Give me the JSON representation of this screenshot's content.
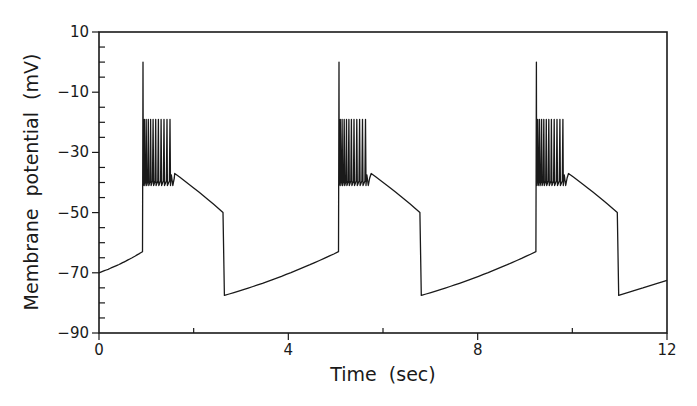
{
  "chart_data": {
    "type": "line",
    "title": "",
    "xlabel": "Time  (sec)",
    "ylabel": "Membrane  potential  (mV)",
    "xlim": [
      0,
      12
    ],
    "ylim": [
      -90,
      10
    ],
    "x_ticks": [
      0,
      4,
      8,
      12
    ],
    "x_tick_labels": [
      "0",
      "4",
      "8",
      "12"
    ],
    "x_minor_step": 2,
    "y_ticks": [
      10,
      -10,
      -30,
      -50,
      -70,
      -90
    ],
    "y_tick_labels": [
      "10",
      "−10",
      "−30",
      "−50",
      "−70",
      "−90"
    ],
    "y_minor_step": 5,
    "grid": false,
    "legend": null,
    "line_color": "#1a1a1a",
    "series": [
      {
        "name": "membrane-potential",
        "description": "Periodic bursting: slow depolarizing ramp, initial spike to ~0 mV, high-frequency spike burst between ~-41 and ~-19 mV, plateau decaying to ~-50 mV, then abrupt hyperpolarization to ~-77.5 mV",
        "cycles": [
          {
            "ramp_start": {
              "t": 0.0,
              "v": -70.0
            },
            "ramp_end": {
              "t": 0.92,
              "v": -63.0
            },
            "initial_spike_peak": {
              "t": 0.93,
              "v": 0.0
            },
            "burst_start_t": 0.93,
            "burst_end_t": 1.5,
            "burst_spikes": 11,
            "burst_peak_v": -19.0,
            "burst_trough_v": -41.0,
            "hump_peak": {
              "t": 1.6,
              "v": -37.0
            },
            "plateau_end": {
              "t": 2.62,
              "v": -50.0
            },
            "hyperpolarized": {
              "t": 2.65,
              "v": -77.5
            }
          },
          {
            "ramp_start": {
              "t": 2.65,
              "v": -77.5
            },
            "ramp_end": {
              "t": 5.06,
              "v": -63.0
            },
            "initial_spike_peak": {
              "t": 5.07,
              "v": 0.0
            },
            "burst_start_t": 5.07,
            "burst_end_t": 5.63,
            "burst_spikes": 11,
            "burst_peak_v": -19.0,
            "burst_trough_v": -41.0,
            "hump_peak": {
              "t": 5.75,
              "v": -37.0
            },
            "plateau_end": {
              "t": 6.78,
              "v": -50.0
            },
            "hyperpolarized": {
              "t": 6.81,
              "v": -77.5
            }
          },
          {
            "ramp_start": {
              "t": 6.81,
              "v": -77.5
            },
            "ramp_end": {
              "t": 9.23,
              "v": -63.0
            },
            "initial_spike_peak": {
              "t": 9.24,
              "v": 0.0
            },
            "burst_start_t": 9.24,
            "burst_end_t": 9.8,
            "burst_spikes": 11,
            "burst_peak_v": -19.0,
            "burst_trough_v": -41.0,
            "hump_peak": {
              "t": 9.92,
              "v": -37.0
            },
            "plateau_end": {
              "t": 10.95,
              "v": -50.0
            },
            "hyperpolarized": {
              "t": 10.98,
              "v": -77.5
            }
          }
        ],
        "end_point": {
          "t": 12.0,
          "v": -72.5
        }
      }
    ]
  }
}
